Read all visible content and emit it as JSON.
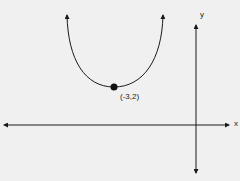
{
  "diagram": {
    "type": "parabola-graph",
    "vertex_label": "(-3,2)",
    "x_axis_label": "x",
    "y_axis_label": "y",
    "colors": {
      "background": "#f0f0f0",
      "stroke": "#1a1a1a"
    }
  }
}
